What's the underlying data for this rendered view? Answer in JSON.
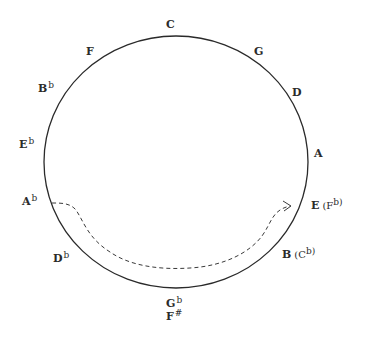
{
  "diagram": {
    "circle": {
      "cx": 176,
      "cy": 162,
      "rx": 132,
      "ry": 126,
      "stroke": "#2a2a2a"
    },
    "notes": [
      {
        "id": "c",
        "main": "C",
        "acc": "",
        "extra": "",
        "extra_acc": "",
        "x": 166,
        "y": 28
      },
      {
        "id": "g",
        "main": "G",
        "acc": "",
        "extra": "",
        "extra_acc": "",
        "x": 254,
        "y": 55
      },
      {
        "id": "d",
        "main": "D",
        "acc": "",
        "extra": "",
        "extra_acc": "",
        "x": 292,
        "y": 96
      },
      {
        "id": "a",
        "main": "A",
        "acc": "",
        "extra": "",
        "extra_acc": "",
        "x": 314,
        "y": 157
      },
      {
        "id": "e",
        "main": "E",
        "acc": "",
        "extra": "(F",
        "extra_acc": "b)",
        "x": 311,
        "y": 209
      },
      {
        "id": "b",
        "main": "B",
        "acc": "",
        "extra": "(C",
        "extra_acc": "b)",
        "x": 282,
        "y": 258
      },
      {
        "id": "gb",
        "main": "G",
        "acc": "b",
        "extra": "",
        "extra_acc": "",
        "x": 166,
        "y": 307
      },
      {
        "id": "fs",
        "main": "F",
        "acc": "#",
        "extra": "",
        "extra_acc": "",
        "x": 166,
        "y": 320
      },
      {
        "id": "db",
        "main": "D",
        "acc": "b",
        "extra": "",
        "extra_acc": "",
        "x": 53,
        "y": 262
      },
      {
        "id": "ab",
        "main": "A",
        "acc": "b",
        "extra": "",
        "extra_acc": "",
        "x": 22,
        "y": 205
      },
      {
        "id": "eb",
        "main": "E",
        "acc": "b",
        "extra": "",
        "extra_acc": "",
        "x": 19,
        "y": 148
      },
      {
        "id": "bb",
        "main": "B",
        "acc": "b",
        "extra": "",
        "extra_acc": "",
        "x": 38,
        "y": 92
      },
      {
        "id": "f",
        "main": "F",
        "acc": "",
        "extra": "",
        "extra_acc": "",
        "x": 86,
        "y": 55
      }
    ],
    "arrow": {
      "style": "dashed",
      "from_note": "Ab",
      "to_note": "E (Fb)",
      "path": "M 52 203 C 62 203, 70 203, 76 210 C 84 222, 88 238, 110 252 C 130 266, 160 270, 190 268 C 225 266, 250 252, 262 236 C 272 222, 272 210, 290 206"
    }
  }
}
